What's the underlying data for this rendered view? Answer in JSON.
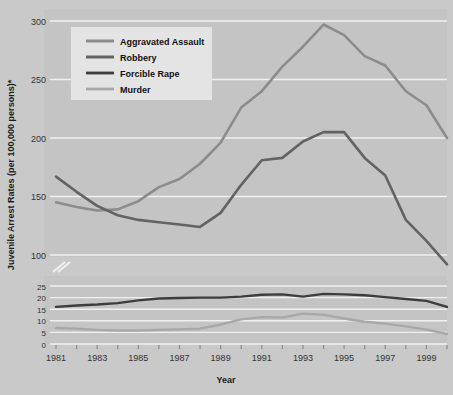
{
  "chart_data": {
    "type": "line",
    "title": "",
    "xlabel": "Year",
    "ylabel": "Juvenile Arrest Rates (per 100,000 persons)*",
    "broken_axis": true,
    "upper_panel": {
      "ylim": [
        100,
        300
      ],
      "ticks": [
        100,
        150,
        200,
        250,
        300
      ]
    },
    "lower_panel": {
      "ylim": [
        0,
        25
      ],
      "ticks": [
        0,
        5,
        10,
        15,
        20,
        25
      ]
    },
    "xlim": [
      1981,
      2000
    ],
    "x_tick_labels": [
      "1981",
      "1983",
      "1985",
      "1987",
      "1989",
      "1991",
      "1993",
      "1995",
      "1997",
      "1999"
    ],
    "x": [
      1981,
      1982,
      1983,
      1984,
      1985,
      1986,
      1987,
      1988,
      1989,
      1990,
      1991,
      1992,
      1993,
      1994,
      1995,
      1996,
      1997,
      1998,
      1999,
      2000
    ],
    "grid": true,
    "legend_position": "top-left-inside",
    "series": [
      {
        "name": "Aggravated Assault",
        "panel": "upper",
        "color": "#8c8c8c",
        "width": 2.6,
        "values": [
          145,
          141,
          138,
          139,
          146,
          158,
          165,
          178,
          196,
          226,
          240,
          261,
          278,
          297,
          288,
          270,
          262,
          240,
          228,
          200
        ]
      },
      {
        "name": "Robbery",
        "panel": "upper",
        "color": "#636363",
        "width": 2.6,
        "values": [
          167,
          154,
          142,
          134,
          130,
          128,
          126,
          124,
          136,
          160,
          181,
          183,
          197,
          205,
          205,
          183,
          168,
          130,
          112,
          92
        ]
      },
      {
        "name": "Forcible Rape",
        "panel": "lower",
        "color": "#3d3d3d",
        "width": 2.4,
        "values": [
          16.0,
          16.6,
          17.0,
          17.6,
          18.8,
          19.6,
          19.8,
          20.0,
          20.0,
          20.4,
          21.2,
          21.4,
          20.4,
          21.6,
          21.4,
          21.0,
          20.2,
          19.4,
          18.6,
          16.0
        ]
      },
      {
        "name": "Murder",
        "panel": "lower",
        "color": "#a8a8a8",
        "width": 2.4,
        "values": [
          6.9,
          6.6,
          6.1,
          5.8,
          5.8,
          6.1,
          6.3,
          6.6,
          8.4,
          10.6,
          11.6,
          11.4,
          13.1,
          12.6,
          11.0,
          9.6,
          8.8,
          7.6,
          6.2,
          4.3
        ]
      }
    ]
  },
  "legend": {
    "items": [
      {
        "label": "Aggravated Assault"
      },
      {
        "label": "Robbery"
      },
      {
        "label": "Forcible Rape"
      },
      {
        "label": "Murder"
      }
    ]
  },
  "colors": {
    "background": "#c9c9c9",
    "plot_background": "#c4c4c4",
    "gridline": "#f0f0f0",
    "legend_background": "#e4e4e4",
    "text": "#1a1a1a"
  }
}
